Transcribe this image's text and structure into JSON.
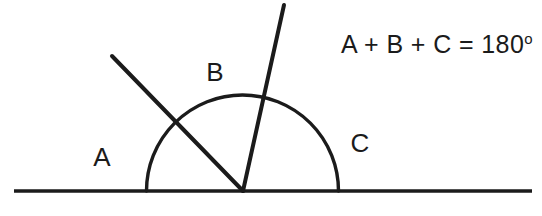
{
  "canvas": {
    "width": 542,
    "height": 216,
    "background": "#ffffff",
    "stroke_color": "#1b1b1b",
    "text_color": "#1b1b1b"
  },
  "diagram": {
    "title_text": "A + B + C = 180",
    "formula": {
      "expression": "A + B + C = 180",
      "degree_symbol": "o",
      "full_text": "A + B + C = 180°",
      "x": 341,
      "y": 30
    },
    "baseline": {
      "name": "straight-line",
      "x1": 14,
      "y1": 191,
      "x2": 532,
      "y2": 191,
      "stroke_width": 3.6
    },
    "vertex": {
      "x": 243,
      "y": 191
    },
    "arc": {
      "center_x": 242.5,
      "center_y": 191,
      "radius": 96,
      "start_x": 146.5,
      "start_y": 191,
      "end_x": 338.5,
      "end_y": 191,
      "stroke_width": 3.4
    },
    "rays": [
      {
        "name": "ray-left",
        "x1": 243,
        "y1": 191,
        "x2": 112,
        "y2": 56,
        "angle_degrees": 134,
        "stroke_width": 4.0
      },
      {
        "name": "ray-right",
        "x1": 243,
        "y1": 191,
        "x2": 284,
        "y2": 5,
        "angle_degrees": 77.6,
        "stroke_width": 4.0
      }
    ],
    "labels": [
      {
        "id": "A",
        "text": "A",
        "x": 102,
        "y": 157
      },
      {
        "id": "B",
        "text": "B",
        "x": 215,
        "y": 72
      },
      {
        "id": "C",
        "text": "C",
        "x": 360,
        "y": 143
      }
    ]
  }
}
